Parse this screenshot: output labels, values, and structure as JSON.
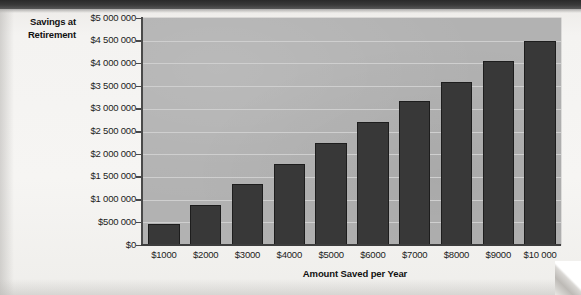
{
  "chart_data": {
    "type": "bar",
    "title": "",
    "xlabel": "Amount Saved per Year",
    "ylabel": "Savings at Retirement",
    "ylabel_lines": [
      "Savings at",
      "Retirement"
    ],
    "categories": [
      "$1000",
      "$2000",
      "$3000",
      "$4000",
      "$5000",
      "$6000",
      "$7000",
      "$8000",
      "$9000",
      "$10 000"
    ],
    "values": [
      470000,
      880000,
      1340000,
      1780000,
      2250000,
      2700000,
      3170000,
      3600000,
      4050000,
      4500000
    ],
    "ylim": [
      0,
      5000000
    ],
    "ytick_values": [
      0,
      500000,
      1000000,
      1500000,
      2000000,
      2500000,
      3000000,
      3500000,
      4000000,
      4500000,
      5000000
    ],
    "ytick_labels": [
      "$0",
      "$500 000",
      "$1 000 000",
      "$1 500 000",
      "$2 000 000",
      "$2 500 000",
      "$3 000 000",
      "$3 500 000",
      "$4 000 000",
      "$4 500 000",
      "$5 000 000"
    ],
    "grid": true,
    "legend": false,
    "legend_position": "none",
    "colors": {
      "bar_fill": "#383838",
      "bar_stroke": "#1d1d1d",
      "plot_background": "#b2b2b2",
      "gridline": "#cfcfcf",
      "axis": "#3d3d3d",
      "text": "#1c1c1c",
      "page_background": "#f4f3f1"
    }
  }
}
